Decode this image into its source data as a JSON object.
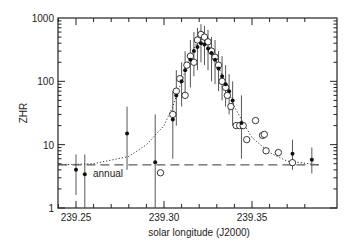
{
  "chart_data": {
    "type": "scatter",
    "title": "",
    "xlabel": "solar longitude (J2000)",
    "ylabel": "ZHR",
    "xlim": [
      239.24,
      239.388
    ],
    "ylim": [
      1,
      1000
    ],
    "yscale": "log",
    "x_ticks": [
      "239.25",
      "239.30",
      "239.35"
    ],
    "y_ticks": [
      "1",
      "10",
      "100",
      "1000"
    ],
    "grid": false,
    "annotations": [
      {
        "text": "annual",
        "x": 239.252,
        "y": 3.6
      }
    ],
    "series": [
      {
        "name": "filled",
        "marker": "filled-circle",
        "points": [
          {
            "x": 239.25,
            "y": 4.0,
            "lo": 1.6,
            "hi": 7
          },
          {
            "x": 239.255,
            "y": 3.4,
            "lo": 1,
            "hi": 7
          },
          {
            "x": 239.279,
            "y": 15,
            "lo": 4,
            "hi": 40
          },
          {
            "x": 239.295,
            "y": 5.3,
            "lo": 1,
            "hi": 30
          },
          {
            "x": 239.305,
            "y": 25,
            "lo": 6,
            "hi": 70
          },
          {
            "x": 239.307,
            "y": 60,
            "lo": 20,
            "hi": 150
          },
          {
            "x": 239.31,
            "y": 100,
            "lo": 40,
            "hi": 200
          },
          {
            "x": 239.312,
            "y": 150,
            "lo": 60,
            "hi": 300
          },
          {
            "x": 239.315,
            "y": 220,
            "lo": 80,
            "hi": 450
          },
          {
            "x": 239.317,
            "y": 300,
            "lo": 120,
            "hi": 600
          },
          {
            "x": 239.319,
            "y": 350,
            "lo": 150,
            "hi": 700
          },
          {
            "x": 239.321,
            "y": 400,
            "lo": 200,
            "hi": 800
          },
          {
            "x": 239.323,
            "y": 380,
            "lo": 180,
            "hi": 750
          },
          {
            "x": 239.325,
            "y": 330,
            "lo": 150,
            "hi": 650
          },
          {
            "x": 239.327,
            "y": 280,
            "lo": 100,
            "hi": 500
          },
          {
            "x": 239.329,
            "y": 220,
            "lo": 90,
            "hi": 450
          },
          {
            "x": 239.331,
            "y": 160,
            "lo": 70,
            "hi": 300
          },
          {
            "x": 239.333,
            "y": 120,
            "lo": 50,
            "hi": 250
          },
          {
            "x": 239.335,
            "y": 90,
            "lo": 40,
            "hi": 180
          },
          {
            "x": 239.337,
            "y": 70,
            "lo": 30,
            "hi": 130
          },
          {
            "x": 239.339,
            "y": 50,
            "lo": 20,
            "hi": 100
          },
          {
            "x": 239.344,
            "y": 22,
            "lo": 6,
            "hi": 60
          },
          {
            "x": 239.373,
            "y": 7.2,
            "lo": 4,
            "hi": 12
          },
          {
            "x": 239.384,
            "y": 5.8,
            "lo": 3.5,
            "hi": 9
          }
        ]
      },
      {
        "name": "open",
        "marker": "open-circle",
        "points": [
          {
            "x": 239.298,
            "y": 3.6
          },
          {
            "x": 239.305,
            "y": 30
          },
          {
            "x": 239.307,
            "y": 70
          },
          {
            "x": 239.309,
            "y": 110
          },
          {
            "x": 239.312,
            "y": 60
          },
          {
            "x": 239.313,
            "y": 180
          },
          {
            "x": 239.315,
            "y": 250
          },
          {
            "x": 239.317,
            "y": 200
          },
          {
            "x": 239.319,
            "y": 450
          },
          {
            "x": 239.321,
            "y": 550
          },
          {
            "x": 239.323,
            "y": 500
          },
          {
            "x": 239.325,
            "y": 420
          },
          {
            "x": 239.327,
            "y": 300
          },
          {
            "x": 239.329,
            "y": 240
          },
          {
            "x": 239.331,
            "y": 180
          },
          {
            "x": 239.333,
            "y": 100
          },
          {
            "x": 239.335,
            "y": 80
          },
          {
            "x": 239.336,
            "y": 60
          },
          {
            "x": 239.338,
            "y": 40
          },
          {
            "x": 239.341,
            "y": 20
          },
          {
            "x": 239.343,
            "y": 20
          },
          {
            "x": 239.345,
            "y": 20
          },
          {
            "x": 239.347,
            "y": 12
          },
          {
            "x": 239.352,
            "y": 24
          },
          {
            "x": 239.356,
            "y": 14
          },
          {
            "x": 239.357,
            "y": 14.5
          },
          {
            "x": 239.358,
            "y": 8
          },
          {
            "x": 239.365,
            "y": 7.5
          },
          {
            "x": 239.373,
            "y": 5.2
          }
        ]
      },
      {
        "name": "model (dotted)",
        "style": "dotted",
        "x": [
          239.24,
          239.26,
          239.28,
          239.29,
          239.3,
          239.305,
          239.31,
          239.315,
          239.32,
          239.325,
          239.33,
          239.335,
          239.34,
          239.345,
          239.35,
          239.36,
          239.37,
          239.388
        ],
        "y": [
          4.8,
          5.0,
          6.5,
          10,
          20,
          40,
          100,
          250,
          480,
          420,
          200,
          90,
          40,
          22,
          13,
          7.5,
          5.5,
          4.8
        ]
      },
      {
        "name": "annual (dashed)",
        "style": "dashed",
        "x": [
          239.24,
          239.388
        ],
        "y": [
          4.8,
          4.8
        ]
      }
    ]
  }
}
